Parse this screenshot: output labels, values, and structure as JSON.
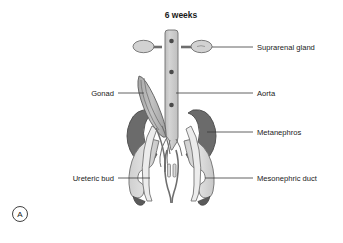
{
  "figure": {
    "title": "6 weeks",
    "panel_label": "A",
    "background_color": "#ffffff",
    "stage": "6 weeks"
  },
  "palette": {
    "aorta_fill": "#c9c9c9",
    "aorta_stroke": "#6e6e6e",
    "aorta_dot": "#4a4a4a",
    "suprarenal_fill": "#d2d2d2",
    "suprarenal_stroke": "#6e6e6e",
    "gonad_fill": "#b4b4b4",
    "gonad_stroke": "#5c5c5c",
    "metanephros_fill": "#6b6b6b",
    "metanephros_stroke": "#4a4a4a",
    "duct_fill": "#d8d8d8",
    "duct_stroke": "#6e6e6e",
    "duct_tip": "#5a5a5a",
    "tubule_fill": "#ececec",
    "tubule_stroke": "#6e6e6e",
    "leader_line": "#3a3a3a",
    "text": "#1a1a1a"
  },
  "labels": {
    "left": [
      {
        "text": "Gonad",
        "target": "gonad"
      },
      {
        "text": "Ureteric bud",
        "target": "ureteric-bud"
      }
    ],
    "right": [
      {
        "text": "Suprarenal gland",
        "target": "suprarenal-gland"
      },
      {
        "text": "Aorta",
        "target": "aorta"
      },
      {
        "text": "Metanephros",
        "target": "metanephros"
      },
      {
        "text": "Mesonephric duct",
        "target": "mesonephric-duct"
      }
    ]
  },
  "structures": {
    "aorta": "Aorta",
    "suprarenal_gland": "Suprarenal gland",
    "gonad": "Gonad",
    "metanephros": "Metanephros",
    "ureteric_bud": "Ureteric bud",
    "mesonephric_duct": "Mesonephric duct"
  }
}
